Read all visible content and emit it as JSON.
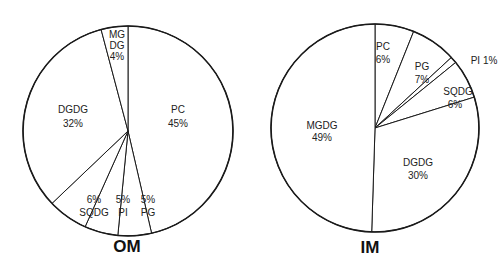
{
  "chart_data": [
    {
      "type": "pie",
      "title": "OM",
      "categories": [
        "PC",
        "PG",
        "PI",
        "SQDG",
        "DGDG",
        "MGDG"
      ],
      "values": [
        45,
        5,
        5,
        6,
        32,
        4
      ],
      "labels": [
        "PC\n45%",
        "5%\nPG",
        "5%\nPI",
        "6%\nSQDG",
        "DGDG\n32%",
        "MG\nDG\n4%"
      ],
      "start_angle_deg": 0,
      "direction": "clockwise",
      "legend": "none"
    },
    {
      "type": "pie",
      "title": "IM",
      "categories": [
        "PC",
        "PG",
        "PI",
        "SQDG",
        "DGDG",
        "MGDG"
      ],
      "values": [
        6,
        7,
        1,
        6,
        30,
        49
      ],
      "labels": [
        "PC\n6%",
        "PG\n7%",
        "PI 1%",
        "SQDG\n6%",
        "DGDG\n30%",
        "MGDG\n49%"
      ],
      "start_angle_deg": 0,
      "direction": "clockwise",
      "legend": "none"
    }
  ],
  "om": {
    "title": "OM",
    "labels": {
      "pc": [
        "PC",
        "45%"
      ],
      "pg": [
        "5%",
        "PG"
      ],
      "pi": [
        "5%",
        "PI"
      ],
      "sqdg": [
        "6%",
        "SQDG"
      ],
      "dgdg": [
        "DGDG",
        "32%"
      ],
      "mgdg": [
        "MG",
        "DG",
        "4%"
      ]
    }
  },
  "im": {
    "title": "IM",
    "labels": {
      "pc": [
        "PC",
        "6%"
      ],
      "pg": [
        "PG",
        "7%"
      ],
      "pi": [
        "PI 1%"
      ],
      "sqdg": [
        "SQDG",
        "6%"
      ],
      "dgdg": [
        "DGDG",
        "30%"
      ],
      "mgdg": [
        "MGDG",
        "49%"
      ]
    }
  }
}
